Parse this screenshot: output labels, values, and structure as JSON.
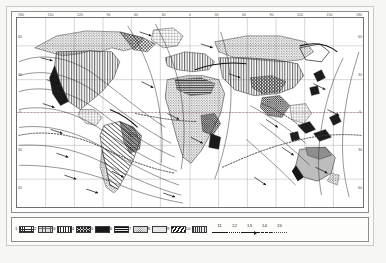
{
  "figure": {
    "type": "thematic-world-map",
    "projection_note": "rectangular world map with curved flow lines",
    "background_color": "#ffffff",
    "frame_color": "#6f6f6c",
    "ink_color": "#1a1a1a"
  },
  "graticule": {
    "longitude_labels": [
      "180",
      "150",
      "120",
      "90",
      "60",
      "30",
      "0",
      "30",
      "60",
      "90",
      "120",
      "150",
      "180"
    ],
    "latitude_labels_left": [
      "60",
      "30",
      "0",
      "30",
      "60"
    ],
    "latitude_labels_right": [
      "60",
      "30",
      "0",
      "30",
      "60"
    ],
    "grid_visible": true
  },
  "legend": {
    "items": [
      {
        "number": "1",
        "swatch": "fine-grid-hatch",
        "kind": "area"
      },
      {
        "number": "2",
        "swatch": "gray-mesh-stipple",
        "kind": "area"
      },
      {
        "number": "3",
        "swatch": "vertical-line-hatch",
        "kind": "area"
      },
      {
        "number": "4",
        "swatch": "cross-diagonal-hatch",
        "kind": "area"
      },
      {
        "number": "5",
        "swatch": "solid-black-fill",
        "kind": "area"
      },
      {
        "number": "6",
        "swatch": "dense-horizontal-hatch",
        "kind": "area"
      },
      {
        "number": "7",
        "swatch": "light-stipple",
        "kind": "area"
      },
      {
        "number": "8",
        "swatch": "light-gray-tone",
        "kind": "area"
      },
      {
        "number": "9",
        "swatch": "bold-diagonal-hatch",
        "kind": "area"
      },
      {
        "number": "10",
        "swatch": "dark-checker-stipple",
        "kind": "area"
      },
      {
        "number": "11",
        "swatch": "solid-line",
        "kind": "line"
      },
      {
        "number": "12",
        "swatch": "dotted-line",
        "kind": "line"
      },
      {
        "number": "13",
        "swatch": "arrow-line",
        "kind": "line"
      },
      {
        "number": "14",
        "swatch": "dashed-line",
        "kind": "line"
      },
      {
        "number": "15",
        "swatch": "fine-dotted-line",
        "kind": "line"
      }
    ]
  }
}
